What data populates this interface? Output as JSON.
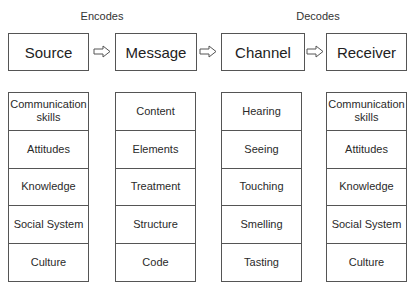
{
  "annotations": {
    "encodes": "Encodes",
    "decodes": "Decodes"
  },
  "stages": [
    {
      "label": "Source"
    },
    {
      "label": "Message"
    },
    {
      "label": "Channel"
    },
    {
      "label": "Receiver"
    }
  ],
  "arrows": [
    "right-hollow-arrow",
    "right-hollow-arrow",
    "right-hollow-arrow"
  ],
  "columns": [
    {
      "stage": "Source",
      "items": [
        "Communication skills",
        "Attitudes",
        "Knowledge",
        "Social System",
        "Culture"
      ]
    },
    {
      "stage": "Message",
      "items": [
        "Content",
        "Elements",
        "Treatment",
        "Structure",
        "Code"
      ]
    },
    {
      "stage": "Channel",
      "items": [
        "Hearing",
        "Seeing",
        "Touching",
        "Smelling",
        "Tasting"
      ]
    },
    {
      "stage": "Receiver",
      "items": [
        "Communication skills",
        "Attitudes",
        "Knowledge",
        "Social System",
        "Culture"
      ]
    }
  ],
  "colors": {
    "border": "#555555",
    "text": "#2a2a2a",
    "background": "#ffffff"
  }
}
